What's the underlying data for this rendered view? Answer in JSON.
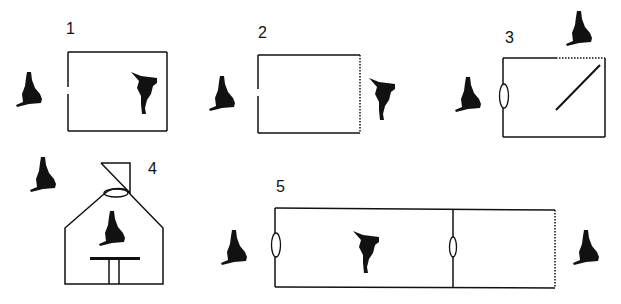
{
  "diagram": {
    "colors": {
      "ink": "#111111",
      "background": "#ffffff"
    },
    "panels": [
      {
        "label": "1",
        "description": "Closed room with opening on left wall; observer outside left, figure inside facing away"
      },
      {
        "label": "2",
        "description": "Room with opening on left wall, dotted (transparent) right wall; observer outside left, figure outside right"
      },
      {
        "label": "3",
        "description": "Room with lens on left wall, dotted top-right wall segment, diagonal mirror inside; observer left, observer above"
      },
      {
        "label": "4",
        "description": "House-shaped enclosure with lens at apex and mirror flag above; observer outside, figure on table inside"
      },
      {
        "label": "5",
        "description": "Two connected rooms with lenses on left and middle walls, dotted right wall; observers at both ends, figure in first room"
      }
    ]
  }
}
